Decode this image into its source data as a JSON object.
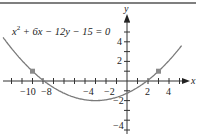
{
  "chart_data": {
    "type": "line",
    "title": "",
    "equation_parts": {
      "pre": "x",
      "exp": "2",
      "post": " + 6x − 12y − 15 = 0"
    },
    "xlabel": "x",
    "ylabel": "y",
    "xlim": [
      -12,
      5.5
    ],
    "ylim": [
      -4.5,
      5.5
    ],
    "x_tick_labels": [
      "−10",
      "−8",
      "−4",
      "−2",
      "2",
      "4"
    ],
    "y_tick_labels": [
      "4",
      "2",
      "−2",
      "−4"
    ],
    "grid": false,
    "series": [
      {
        "name": "x^2 + 6x - 12y - 15 = 0",
        "function": "y = (x^2 + 6x - 15)/12",
        "x": [
          -11.8,
          -10,
          -9,
          -8,
          -6,
          -4,
          -3,
          -2,
          0,
          2,
          3,
          4,
          5.2
        ],
        "values": [
          4.36,
          1.46,
          1.0,
          0.08,
          -1.25,
          -1.92,
          -2.0,
          -1.92,
          -1.25,
          0.08,
          1.0,
          2.08,
          3.07
        ],
        "color": "#7a7a7a"
      }
    ],
    "marked_points": [
      {
        "x": -9,
        "y": 1
      },
      {
        "x": 3,
        "y": 1
      }
    ],
    "vertex": {
      "x": -3,
      "y": -2
    }
  }
}
